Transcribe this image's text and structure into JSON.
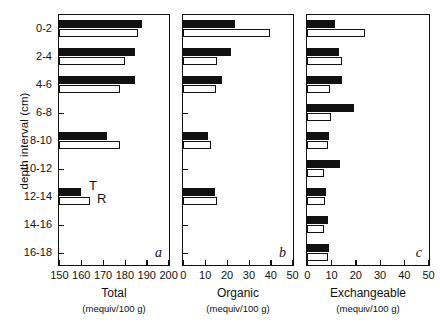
{
  "figure": {
    "y_axis_title": "depth interval (cm)",
    "depth_intervals": [
      "0-2",
      "2-4",
      "4-6",
      "6-8",
      "8-10",
      "10-12",
      "12-14",
      "14-16",
      "16-18"
    ],
    "series_legend": [
      {
        "key": "T",
        "label": "T",
        "style": "filled-black-bar"
      },
      {
        "key": "R",
        "label": "R",
        "style": "open-white-bar"
      }
    ],
    "unit_label": "(mequiv/100 g)"
  },
  "chart_data": [
    {
      "type": "bar",
      "orientation": "horizontal",
      "panel_letter": "a",
      "title": "Total",
      "xlabel": "Total",
      "xunit": "(mequiv/100 g)",
      "ylabel": "depth interval (cm)",
      "xlim": [
        150,
        200
      ],
      "xticks": [
        150,
        160,
        170,
        180,
        190,
        200
      ],
      "categories": [
        "0-2",
        "2-4",
        "4-6",
        "6-8",
        "8-10",
        "10-12",
        "12-14",
        "14-16",
        "16-18"
      ],
      "grid": false,
      "legend": [
        "T",
        "R"
      ],
      "series": [
        {
          "name": "T",
          "fill": "#111111",
          "values": [
            188,
            185,
            185,
            null,
            172,
            null,
            160,
            null,
            null
          ]
        },
        {
          "name": "R",
          "fill": "#ffffff",
          "values": [
            186,
            180,
            178,
            null,
            178,
            null,
            164,
            null,
            null
          ]
        }
      ]
    },
    {
      "type": "bar",
      "orientation": "horizontal",
      "panel_letter": "b",
      "title": "Organic",
      "xlabel": "Organic",
      "xunit": "(mequiv/100 g)",
      "ylabel": "depth interval (cm)",
      "xlim": [
        0,
        50
      ],
      "xticks": [
        0,
        10,
        20,
        30,
        40,
        50
      ],
      "categories": [
        "0-2",
        "2-4",
        "4-6",
        "6-8",
        "8-10",
        "10-12",
        "12-14",
        "14-16",
        "16-18"
      ],
      "grid": false,
      "legend": [
        "T",
        "R"
      ],
      "series": [
        {
          "name": "T",
          "fill": "#111111",
          "values": [
            24,
            22,
            18,
            null,
            11.5,
            null,
            14.5,
            null,
            null
          ]
        },
        {
          "name": "R",
          "fill": "#ffffff",
          "values": [
            40,
            15.5,
            15,
            null,
            13,
            null,
            15.5,
            null,
            null
          ]
        }
      ]
    },
    {
      "type": "bar",
      "orientation": "horizontal",
      "panel_letter": "c",
      "title": "Exchangeable",
      "xlabel": "Exchangeable",
      "xunit": "(mequiv/100 g)",
      "ylabel": "depth interval (cm)",
      "xlim": [
        0,
        50
      ],
      "xticks": [
        0,
        10,
        20,
        30,
        40,
        50
      ],
      "categories": [
        "0-2",
        "2-4",
        "4-6",
        "6-8",
        "8-10",
        "10-12",
        "12-14",
        "14-16",
        "16-18"
      ],
      "grid": false,
      "legend": [
        "T",
        "R"
      ],
      "series": [
        {
          "name": "T",
          "fill": "#111111",
          "values": [
            11.5,
            13,
            14.5,
            19.5,
            9,
            13.5,
            8,
            8.5,
            9
          ]
        },
        {
          "name": "R",
          "fill": "#ffffff",
          "values": [
            24,
            14.5,
            9.5,
            10,
            8.5,
            7,
            7.5,
            7,
            8.5
          ]
        }
      ]
    }
  ],
  "panels_geometry": [
    {
      "left": 58,
      "width": 112
    },
    {
      "left": 182,
      "width": 112
    },
    {
      "left": 306,
      "width": 124
    }
  ]
}
